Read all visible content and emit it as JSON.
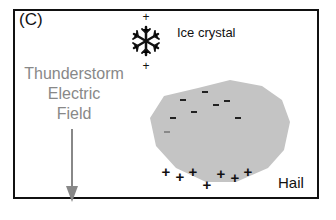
{
  "panel_label": "(C)",
  "labels": {
    "ice_crystal": "Ice crystal",
    "field_line1": "Thunderstorm",
    "field_line2": "Electric",
    "field_line3": "Field",
    "hail": "Hail"
  },
  "symbols": {
    "plus": "+",
    "minus": "-"
  },
  "colors": {
    "border": "#111111",
    "hail_fill": "#c4c4c4",
    "field_text": "#888888",
    "arrow": "#888888"
  }
}
